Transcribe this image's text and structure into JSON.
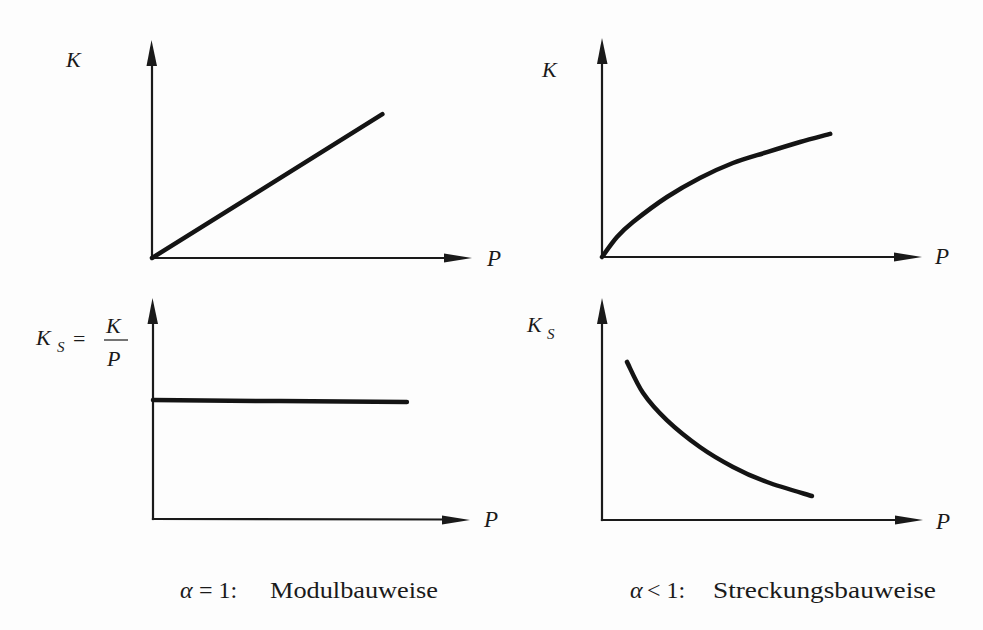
{
  "panels": {
    "top_left": {
      "y_label": "K",
      "x_label": "P"
    },
    "top_right": {
      "y_label": "K",
      "x_label": "P"
    },
    "bottom_left": {
      "y_label_main": "K",
      "y_label_sub": "S",
      "equals": "=",
      "fraction_numerator": "K",
      "fraction_denominator": "P",
      "x_label": "P"
    },
    "bottom_right": {
      "y_label_main": "K",
      "y_label_sub": "S",
      "x_label": "P"
    }
  },
  "captions": {
    "left": {
      "symbol": "α",
      "relation": "= 1:",
      "label": "Modulbauweise"
    },
    "right": {
      "symbol": "α",
      "relation": "< 1:",
      "label": "Streckungsbauweise"
    }
  },
  "colors": {
    "ink": "#1a1a1a",
    "background": "#fdfdfd"
  },
  "chart_data": [
    {
      "type": "line",
      "panel": "top_left",
      "group": "α = 1: Modulbauweise",
      "title": "",
      "xlabel": "P",
      "ylabel": "K",
      "xlim": [
        0,
        1
      ],
      "ylim": [
        0,
        1
      ],
      "grid": false,
      "ticks": false,
      "shape": "linear increasing from origin",
      "series": [
        {
          "name": "K(P)",
          "x": [
            0,
            0.72
          ],
          "y": [
            0,
            0.66
          ]
        }
      ]
    },
    {
      "type": "line",
      "panel": "top_right",
      "group": "α < 1: Streckungsbauweise",
      "title": "",
      "xlabel": "P",
      "ylabel": "K",
      "xlim": [
        0,
        1
      ],
      "ylim": [
        0,
        1
      ],
      "grid": false,
      "ticks": false,
      "shape": "concave increasing from origin (degressive)",
      "series": [
        {
          "name": "K(P)",
          "x": [
            0,
            0.047,
            0.097,
            0.203,
            0.306,
            0.409,
            0.516,
            0.619,
            0.713
          ],
          "y": [
            0,
            0.091,
            0.16,
            0.274,
            0.361,
            0.429,
            0.479,
            0.525,
            0.562
          ]
        }
      ]
    },
    {
      "type": "line",
      "panel": "bottom_left",
      "group": "α = 1: Modulbauweise",
      "title": "",
      "xlabel": "P",
      "ylabel": "K_S = K/P",
      "xlim": [
        0,
        1
      ],
      "ylim": [
        0,
        1
      ],
      "grid": false,
      "ticks": false,
      "shape": "constant (horizontal)",
      "series": [
        {
          "name": "K_S(P)",
          "x": [
            0,
            0.806
          ],
          "y": [
            0.538,
            0.529
          ]
        }
      ]
    },
    {
      "type": "line",
      "panel": "bottom_right",
      "group": "α < 1: Streckungsbauweise",
      "title": "",
      "xlabel": "P",
      "ylabel": "K_S",
      "xlim": [
        0,
        1
      ],
      "ylim": [
        0,
        1
      ],
      "grid": false,
      "ticks": false,
      "shape": "convex decreasing",
      "series": [
        {
          "name": "K_S(P)",
          "x": [
            0.078,
            0.128,
            0.202,
            0.305,
            0.408,
            0.514,
            0.654
          ],
          "y": [
            0.712,
            0.572,
            0.45,
            0.329,
            0.239,
            0.171,
            0.108
          ]
        }
      ]
    }
  ]
}
